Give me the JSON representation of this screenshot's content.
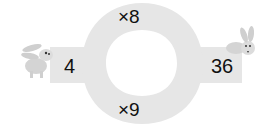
{
  "puzzle": {
    "start_value": "4",
    "end_value": "36",
    "top_operation": "×8",
    "bottom_operation": "×9"
  },
  "colors": {
    "ring_fill": "#e6e6e6",
    "background": "#ffffff",
    "text": "#111111"
  },
  "icons": {
    "left": "rabbit-icon",
    "right": "rabbit-icon"
  }
}
